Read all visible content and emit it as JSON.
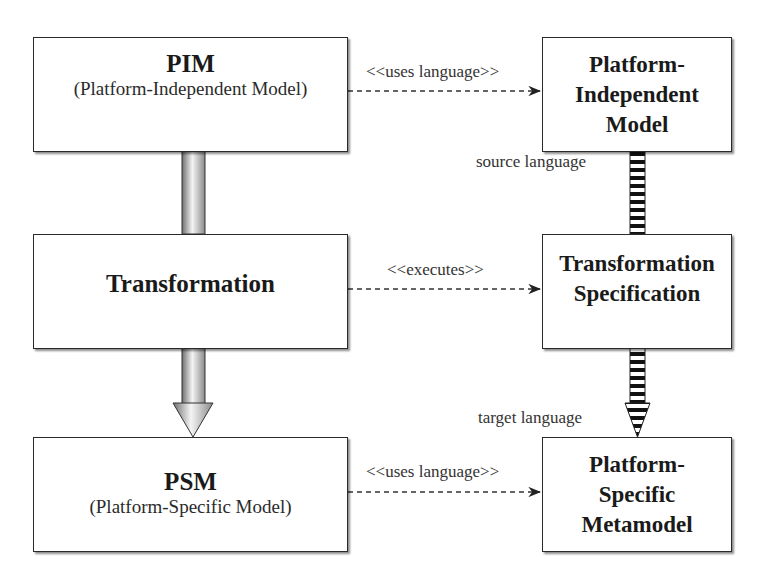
{
  "boxes": {
    "pim": {
      "title": "PIM",
      "subtitle": "(Platform-Independent Model)"
    },
    "transformation": {
      "title": "Transformation"
    },
    "psm": {
      "title": "PSM",
      "subtitle": "(Platform-Specific Model)"
    },
    "pim_metamodel": {
      "line1": "Platform-",
      "line2": "Independent",
      "line3": "Model"
    },
    "transformation_spec": {
      "line1": "Transformation",
      "line2": "Specification"
    },
    "psm_metamodel": {
      "line1": "Platform-",
      "line2": "Specific",
      "line3": "Metamodel"
    }
  },
  "connectors": {
    "pim_uses": "<<uses language>>",
    "transformation_executes": "<<executes>>",
    "psm_uses": "<<uses language>>",
    "source_language": "source language",
    "target_language": "target language"
  },
  "colors": {
    "border": "#2a2a2a",
    "stripe": "#111111",
    "shade_dark": "#7a7a7a",
    "shade_light": "#f2f2f2"
  }
}
